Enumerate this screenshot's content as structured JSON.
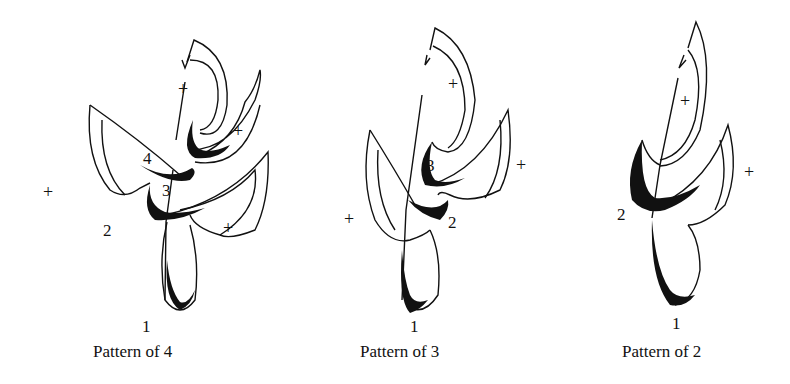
{
  "figures": [
    {
      "caption": "Pattern of 4",
      "beats": [
        "1",
        "2",
        "3",
        "4"
      ],
      "plus_marks": [
        "+",
        "+",
        "+",
        "+"
      ]
    },
    {
      "caption": "Pattern of 3",
      "beats": [
        "1",
        "2",
        "3"
      ],
      "plus_marks": [
        "+",
        "+",
        "+"
      ]
    },
    {
      "caption": "Pattern of 2",
      "beats": [
        "1",
        "2"
      ],
      "plus_marks": [
        "+",
        "+"
      ]
    }
  ]
}
